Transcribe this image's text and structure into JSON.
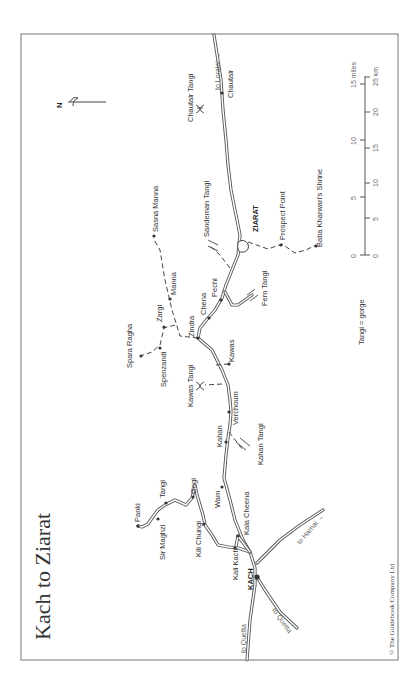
{
  "map": {
    "title": "Kach to Ziarat",
    "copyright": "© The Guidebook Company Ltd",
    "legend": {
      "gorge_note": "Tangi = gorge"
    },
    "north_label": "N",
    "scale": {
      "miles_ticks": [
        "0",
        "5",
        "10",
        "15 miles"
      ],
      "km_ticks": [
        "0",
        "5",
        "10",
        "15",
        "20",
        "25 km"
      ]
    },
    "directions": {
      "to_loralai": "to Loralai →",
      "to_harnai": "to Harnai →",
      "to_quetta_main": "to Quetta",
      "to_quetta_branch": "to Quetta"
    },
    "towns": {
      "kach": "KACH",
      "ziarat": "ZIARAT"
    },
    "places": {
      "chautair": "Chautair",
      "chautair_tangi": "Chautair Tangi",
      "sandeman_tangi": "Sandeman Tangi",
      "prospect_point": "Prospect Point",
      "baba_kharwari": "Baba Kharwari's Shrine",
      "sasna_manna": "Sasna Manna",
      "manna": "Manna",
      "zargi": "Zargi",
      "spara_ragha": "Spara Ragha",
      "spenzandi": "Spenzandi",
      "zindra": "Zindra",
      "chena": "Chena",
      "pechi": "Pechi",
      "fern_tangi": "Fern Tangi",
      "kawas": "Kawas",
      "kawas_tangi": "Kawas Tangi",
      "verchoum": "Verchoum",
      "kahan": "Kahan",
      "kahan_tangi": "Kahan Tangi",
      "panki": "Panki",
      "tangi": "Tangi",
      "sir_maghzi": "Sir Maghzi",
      "gogi": "Gogi",
      "kili_chungi": "Kili Chungi",
      "wam": "Wam",
      "kala_cheena": "Kala Cheena",
      "kali_kach": "Kali Kach"
    }
  }
}
